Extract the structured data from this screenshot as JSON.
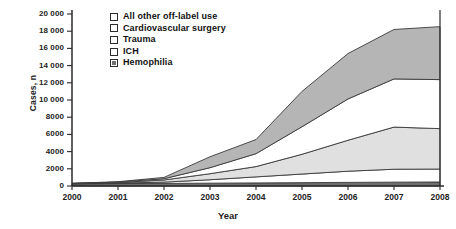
{
  "chart_data": {
    "type": "area",
    "stacked": true,
    "title": "",
    "xlabel": "Year",
    "ylabel": "Cases, n",
    "categories": [
      "2000",
      "2001",
      "2002",
      "2003",
      "2004",
      "2005",
      "2006",
      "2007",
      "2008"
    ],
    "x": [
      2000,
      2001,
      2002,
      2003,
      2004,
      2005,
      2006,
      2007,
      2008
    ],
    "xlim": [
      2000,
      2008
    ],
    "ylim": [
      0,
      20000
    ],
    "ytick_values": [
      0,
      2000,
      4000,
      6000,
      8000,
      10000,
      12000,
      14000,
      16000,
      18000,
      20000
    ],
    "ytick_labels": [
      "0",
      "2000",
      "4000",
      "6000",
      "8000",
      "10 000",
      "12 000",
      "14 000",
      "16 000",
      "18 000",
      "20 000"
    ],
    "grid": false,
    "legend_position": "top-left-inside",
    "series": [
      {
        "name": "Hemophilia",
        "color": "#6e6e6e",
        "swatch": "filled-dark",
        "values": [
          250,
          280,
          300,
          330,
          360,
          390,
          420,
          450,
          470
        ]
      },
      {
        "name": "ICH",
        "color": "#ffffff",
        "swatch": "open",
        "values": [
          20,
          60,
          150,
          400,
          700,
          1000,
          1300,
          1500,
          1500
        ]
      },
      {
        "name": "Trauma",
        "color": "#e0e0e0",
        "swatch": "open",
        "values": [
          20,
          60,
          250,
          700,
          1200,
          2300,
          3600,
          4900,
          4700
        ]
      },
      {
        "name": "Cardiovascular surgery",
        "color": "#ffffff",
        "swatch": "open",
        "values": [
          10,
          50,
          150,
          700,
          1500,
          3200,
          4800,
          5600,
          5700
        ]
      },
      {
        "name": "All other off-label use",
        "color": "#b5b5b5",
        "swatch": "open",
        "values": [
          10,
          50,
          150,
          1270,
          1640,
          4110,
          5280,
          5750,
          6160
        ]
      }
    ],
    "totals": [
      310,
      500,
      1000,
      3400,
      5400,
      11000,
      15400,
      18200,
      18530
    ]
  },
  "legend": {
    "items": [
      {
        "label": "All other off-label use"
      },
      {
        "label": "Cardiovascular surgery"
      },
      {
        "label": "Trauma"
      },
      {
        "label": "ICH"
      },
      {
        "label": "Hemophilia"
      }
    ]
  }
}
